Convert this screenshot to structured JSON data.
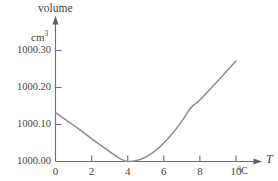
{
  "chart_data": {
    "type": "line",
    "title": "",
    "subtitle": "",
    "ylabel": "volume",
    "yunit": "cm",
    "yunit_exponent": "3",
    "xlabel": "T",
    "xunit": "°C",
    "xlim": [
      0,
      10.5
    ],
    "ylim": [
      999.995,
      1000.35
    ],
    "grid": false,
    "legend": null,
    "x_ticks": [
      0,
      2,
      4,
      6,
      8,
      10
    ],
    "x_tick_labels": [
      "0",
      "2",
      "4",
      "6",
      "8",
      "10"
    ],
    "y_ticks": [
      1000.0,
      1000.1,
      1000.2,
      1000.3
    ],
    "y_tick_labels": [
      "1000.00",
      "1000.10",
      "1000.20",
      "1000.30"
    ],
    "series": [
      {
        "name": "volume of water",
        "color": "#8c8c8c",
        "x": [
          0,
          0.5,
          1,
          1.5,
          2,
          2.5,
          3,
          3.5,
          4,
          4.5,
          5,
          5.5,
          6,
          6.5,
          7,
          7.5,
          8,
          8.5,
          9,
          9.5,
          10
        ],
        "y": [
          1000.132,
          1000.115,
          1000.098,
          1000.08,
          1000.062,
          1000.044,
          1000.027,
          1000.01,
          1000.0,
          1000.003,
          1000.012,
          1000.028,
          1000.05,
          1000.077,
          1000.109,
          1000.145,
          1000.166,
          1000.192,
          1000.218,
          1000.245,
          1000.272
        ]
      }
    ],
    "annotations": [
      {
        "name": "minimum-point",
        "x": 4,
        "y": 1000.0,
        "text": ""
      }
    ]
  },
  "axes": {
    "y_axis_name": "volume-axis",
    "x_axis_name": "temperature-axis",
    "y_arrow": true,
    "x_arrow": true
  },
  "colors": {
    "curve": "#8c8c8c",
    "axis": "#6e6e6e",
    "text": "#3f3f3f",
    "background": "#ffffff"
  }
}
